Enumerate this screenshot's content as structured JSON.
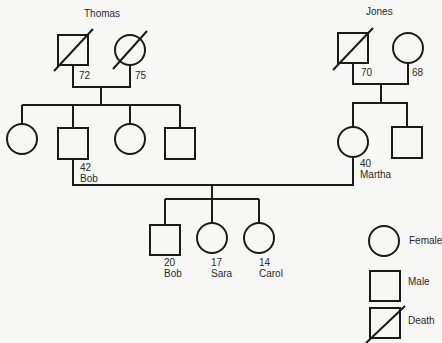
{
  "diagram": {
    "type": "genogram",
    "families": {
      "paternal": {
        "surname": "Thomas",
        "father": {
          "gender": "male",
          "deceased": true,
          "age": "72"
        },
        "mother": {
          "gender": "female",
          "deceased": true,
          "age": "75"
        },
        "children": [
          {
            "gender": "female",
            "name": "",
            "age": ""
          },
          {
            "gender": "male",
            "name": "Bob",
            "age": "42"
          },
          {
            "gender": "female",
            "name": "",
            "age": ""
          },
          {
            "gender": "male",
            "name": "",
            "age": ""
          }
        ]
      },
      "maternal": {
        "surname": "Jones",
        "father": {
          "gender": "male",
          "deceased": true,
          "age": "70"
        },
        "mother": {
          "gender": "female",
          "deceased": false,
          "age": "68"
        },
        "children": [
          {
            "gender": "female",
            "name": "Martha",
            "age": "40"
          },
          {
            "gender": "male",
            "name": "",
            "age": ""
          }
        ]
      }
    },
    "nuclear_family": {
      "husband": {
        "name": "Bob",
        "age": "42"
      },
      "wife": {
        "name": "Martha",
        "age": "40"
      },
      "children": [
        {
          "gender": "male",
          "name": "Bob",
          "age": "20"
        },
        {
          "gender": "female",
          "name": "Sara",
          "age": "17"
        },
        {
          "gender": "female",
          "name": "Carol",
          "age": "14"
        }
      ]
    },
    "legend": [
      {
        "symbol": "circle",
        "label": "Female"
      },
      {
        "symbol": "square",
        "label": "Male"
      },
      {
        "symbol": "square-slash",
        "label": "Death"
      }
    ]
  }
}
